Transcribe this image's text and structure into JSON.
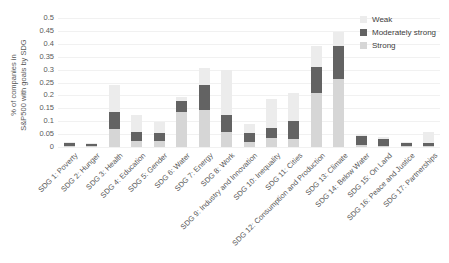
{
  "chart_data": {
    "type": "bar",
    "stacked": true,
    "title": "",
    "ylabel_line1": "% of companies in",
    "ylabel_line2": "S&P500 with goals by SDG",
    "xlabel": "",
    "ylim": [
      0,
      0.5
    ],
    "grid": true,
    "legend_position": "top-right",
    "yticks": [
      "0",
      "0.05",
      "0.1",
      "0.15",
      "0.2",
      "0.25",
      "0.3",
      "0.35",
      "0.4",
      "0.45",
      "0.5"
    ],
    "ytick_values": [
      0,
      0.05,
      0.1,
      0.15,
      0.2,
      0.25,
      0.3,
      0.35,
      0.4,
      0.45,
      0.5
    ],
    "categories": [
      "SDG 1: Poverty",
      "SDG 2: Hunger",
      "SDG 3: Health",
      "SDG 4: Education",
      "SDG 5: Gender",
      "SDG 6: Water",
      "SDG 7: Energy",
      "SDG 8: Work",
      "SDG 9: Industry and Innovation",
      "SDG 10: Inequality",
      "SDG 11: Cities",
      "SDG 12: Consumption and Production",
      "SDG 13: Climate",
      "SDG 14: Below Water",
      "SDG 15: On Land",
      "SDG 16: Peace and Justice",
      "SDG 17: Partnerships"
    ],
    "series": [
      {
        "name": "Strong",
        "color": "#d6d6d6",
        "values": [
          0.005,
          0.004,
          0.07,
          0.025,
          0.024,
          0.135,
          0.145,
          0.06,
          0.02,
          0.035,
          0.03,
          0.21,
          0.265,
          0.008,
          0.005,
          0.004,
          0.004
        ]
      },
      {
        "name": "Moderately strong",
        "color": "#636363",
        "values": [
          0.01,
          0.006,
          0.065,
          0.035,
          0.03,
          0.045,
          0.095,
          0.065,
          0.035,
          0.04,
          0.07,
          0.1,
          0.125,
          0.034,
          0.025,
          0.012,
          0.012
        ]
      },
      {
        "name": "Weak",
        "color": "#ececec",
        "values": [
          0.004,
          0.004,
          0.105,
          0.065,
          0.041,
          0.012,
          0.065,
          0.175,
          0.035,
          0.11,
          0.11,
          0.08,
          0.055,
          0.01,
          0.007,
          0.004,
          0.044
        ]
      }
    ]
  }
}
